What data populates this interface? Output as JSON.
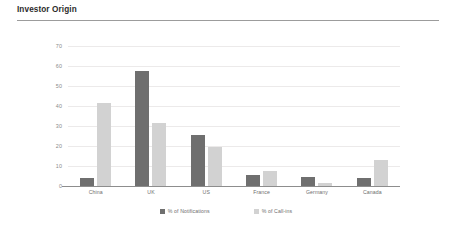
{
  "header": {
    "title": "Investor Origin"
  },
  "chart_data": {
    "type": "bar",
    "title": "Investor Origin",
    "xlabel": "",
    "ylabel": "",
    "ylim": [
      0,
      70
    ],
    "yticks": [
      0,
      10,
      20,
      30,
      40,
      50,
      60,
      70
    ],
    "grid": true,
    "legend_position": "bottom",
    "categories": [
      "China",
      "UK",
      "US",
      "France",
      "Germany",
      "Canada"
    ],
    "series": [
      {
        "name": "% of Notifications",
        "color": "#6f6f6f",
        "values": [
          4,
          57.5,
          25.5,
          5.5,
          4.5,
          4
        ]
      },
      {
        "name": "% of Call-ins",
        "color": "#d2d2d2",
        "values": [
          41.5,
          31.5,
          19.5,
          7.5,
          1.5,
          13
        ]
      }
    ]
  }
}
